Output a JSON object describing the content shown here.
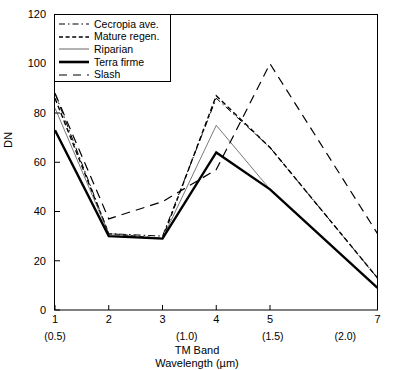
{
  "chart_data": {
    "type": "line",
    "title": "",
    "xlabel": "TM Band Wavelength (µm)",
    "xlabel_line1": "TM Band",
    "xlabel_line2": "Wavelength (µm)",
    "ylabel": "DN",
    "ylim": [
      0,
      120
    ],
    "yticks": [
      0,
      20,
      40,
      60,
      80,
      100,
      120
    ],
    "grid": false,
    "legend_position": "upper-left-inside",
    "categories": [
      "1",
      "2",
      "3",
      "4",
      "5",
      "7"
    ],
    "x": [
      1,
      2,
      3,
      4,
      5,
      7
    ],
    "x_positions": [
      1,
      2,
      3,
      4,
      5,
      7
    ],
    "xtick_labels": [
      "1",
      "2",
      "3",
      "4",
      "5",
      "7"
    ],
    "wavelength_labels": [
      "(0.5)",
      "(1.0)",
      "(1.5)",
      "(2.0)"
    ],
    "wavelength_values": [
      0.5,
      1.0,
      1.5,
      2.0
    ],
    "wavelength_positions": [
      1.0,
      3.45,
      5.05,
      6.4
    ],
    "series": [
      {
        "name": "Cecropia ave.",
        "style": "dash-dot",
        "width": 1,
        "color": "#000000",
        "values": [
          88,
          31,
          30,
          86,
          66,
          13
        ]
      },
      {
        "name": "Mature regen.",
        "style": "dashed",
        "width": 1.4,
        "color": "#000000",
        "values": [
          86,
          31,
          29,
          87,
          66,
          13
        ]
      },
      {
        "name": "Riparian",
        "style": "solid",
        "width": 0.8,
        "color": "#555555",
        "values": [
          82,
          31,
          29,
          75,
          49,
          9
        ]
      },
      {
        "name": "Terra firme",
        "style": "solid",
        "width": 2.4,
        "color": "#000000",
        "values": [
          73,
          30,
          29,
          64,
          49,
          9
        ]
      },
      {
        "name": "Slash",
        "style": "long-dash",
        "width": 1.2,
        "color": "#000000",
        "values": [
          88,
          37,
          44,
          57,
          100,
          31
        ]
      }
    ]
  },
  "axis": {
    "y_label": "DN",
    "y_tick_labels": [
      "0",
      "20",
      "40",
      "60",
      "80",
      "100",
      "120"
    ],
    "x_tick_labels": [
      "1",
      "2",
      "3",
      "4",
      "5",
      "7"
    ],
    "x_sub_labels": [
      "(0.5)",
      "(1.0)",
      "(1.5)",
      "(2.0)"
    ],
    "x_title_line1": "TM Band",
    "x_title_line2": "Wavelength (µm)"
  },
  "legend": {
    "items": [
      {
        "label": "Cecropia ave."
      },
      {
        "label": "Mature regen."
      },
      {
        "label": "Riparian"
      },
      {
        "label": "Terra firme"
      },
      {
        "label": "Slash"
      }
    ]
  },
  "colors": {
    "axis": "#000000",
    "background": "#ffffff",
    "riparian": "#555555"
  }
}
